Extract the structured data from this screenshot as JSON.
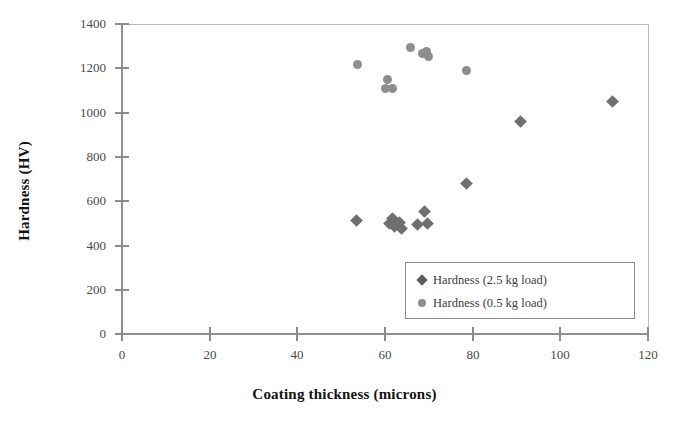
{
  "chart_data": {
    "type": "scatter",
    "title": "",
    "xlabel": "Coating thickness (microns)",
    "ylabel": "Hardness (HV)",
    "xlim": [
      0,
      120
    ],
    "ylim": [
      0,
      1400
    ],
    "xticks": [
      0,
      20,
      40,
      60,
      80,
      100,
      120
    ],
    "yticks": [
      0,
      200,
      400,
      600,
      800,
      1000,
      1200,
      1400
    ],
    "xtick_labels": [
      "0",
      "20",
      "40",
      "60",
      "80",
      "100",
      "120"
    ],
    "ytick_labels": [
      "0",
      "200",
      "400",
      "600",
      "800",
      "1000",
      "1200",
      "1400"
    ],
    "grid": false,
    "legend_position": "lower right",
    "series": [
      {
        "name": "Hardness (2.5 kg load)",
        "marker": "diamond",
        "color": "#6f6f6f",
        "points": [
          {
            "x": 53.5,
            "y": 512
          },
          {
            "x": 61.0,
            "y": 500
          },
          {
            "x": 61.8,
            "y": 520
          },
          {
            "x": 62.2,
            "y": 487
          },
          {
            "x": 63.2,
            "y": 505
          },
          {
            "x": 63.8,
            "y": 478
          },
          {
            "x": 67.5,
            "y": 495
          },
          {
            "x": 69.0,
            "y": 552
          },
          {
            "x": 69.8,
            "y": 497
          },
          {
            "x": 78.6,
            "y": 680
          },
          {
            "x": 91.0,
            "y": 958
          },
          {
            "x": 112.0,
            "y": 1052
          }
        ]
      },
      {
        "name": "Hardness (0.5 kg load)",
        "marker": "circle",
        "color": "#8e8e8e",
        "points": [
          {
            "x": 53.8,
            "y": 1218
          },
          {
            "x": 60.6,
            "y": 1150
          },
          {
            "x": 60.2,
            "y": 1110
          },
          {
            "x": 61.6,
            "y": 1108
          },
          {
            "x": 65.8,
            "y": 1295
          },
          {
            "x": 68.6,
            "y": 1268
          },
          {
            "x": 69.4,
            "y": 1275
          },
          {
            "x": 70.0,
            "y": 1252
          },
          {
            "x": 78.5,
            "y": 1188
          }
        ]
      }
    ]
  },
  "legend": {
    "entries": [
      {
        "label": "Hardness (2.5 kg load)",
        "marker": "diamond"
      },
      {
        "label": "Hardness (0.5 kg load)",
        "marker": "circle"
      }
    ]
  }
}
